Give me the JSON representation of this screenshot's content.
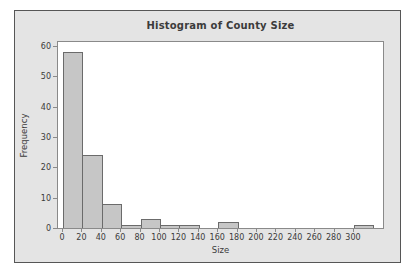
{
  "chart_data": {
    "type": "bar",
    "chart_kind": "histogram",
    "title": "Histogram of County Size",
    "xlabel": "Size",
    "ylabel": "Frequency",
    "x_ticks": [
      0,
      20,
      40,
      60,
      80,
      100,
      120,
      140,
      160,
      180,
      200,
      220,
      240,
      260,
      280,
      300
    ],
    "y_ticks": [
      0,
      10,
      20,
      30,
      40,
      50,
      60
    ],
    "xlim": [
      0,
      331
    ],
    "ylim": [
      0,
      61.5
    ],
    "bin_width": 20,
    "bins": [
      {
        "start": 0,
        "end": 20,
        "count": 58
      },
      {
        "start": 20,
        "end": 40,
        "count": 24
      },
      {
        "start": 40,
        "end": 60,
        "count": 8
      },
      {
        "start": 60,
        "end": 80,
        "count": 1
      },
      {
        "start": 80,
        "end": 100,
        "count": 3
      },
      {
        "start": 100,
        "end": 120,
        "count": 1
      },
      {
        "start": 120,
        "end": 140,
        "count": 1
      },
      {
        "start": 140,
        "end": 160,
        "count": 0
      },
      {
        "start": 160,
        "end": 180,
        "count": 2
      },
      {
        "start": 180,
        "end": 200,
        "count": 0
      },
      {
        "start": 200,
        "end": 220,
        "count": 0
      },
      {
        "start": 220,
        "end": 240,
        "count": 0
      },
      {
        "start": 240,
        "end": 260,
        "count": 0
      },
      {
        "start": 260,
        "end": 280,
        "count": 0
      },
      {
        "start": 280,
        "end": 300,
        "count": 0
      },
      {
        "start": 300,
        "end": 320,
        "count": 1
      }
    ],
    "grid": false,
    "legend": "none",
    "colors": {
      "figure-bg": "#e4e4e4",
      "plot-bg": "#ffffff",
      "bar-fill": "#c6c6c6",
      "bar-border": "#6b6b6b",
      "frame-border": "#8a8a8a",
      "outer-border": "#565656",
      "text": "#3b3b3b"
    }
  }
}
